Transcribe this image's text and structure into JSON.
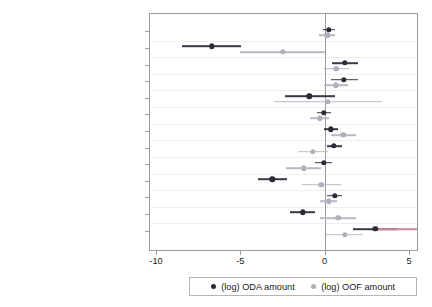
{
  "chart_data": {
    "type": "scatter",
    "title": "",
    "xlabel": "",
    "ylabel": "",
    "xlim": [
      -10,
      5
    ],
    "xticks": [
      -10,
      -5,
      0,
      5
    ],
    "xtick_labels": [
      "-10",
      "-5",
      "0",
      "5"
    ],
    "grid": true,
    "grid_orientation": "horizontal",
    "zero_reference_line": 0,
    "legend_position": "bottom",
    "orientation": "horizontal",
    "categories": [
      "UN voting with China",
      "Taiwan recognition",
      "Historical probability",
      "Trade with China (log)",
      "Oil dummy",
      "Debt/GDP",
      "Stability",
      "Polity",
      "Control of corruption",
      "GDP per capita (log)",
      "Killed from disasters (log)",
      "Population (log)",
      "English language"
    ],
    "series": [
      {
        "name": "(log) ODA amount",
        "color": "#2b2b36",
        "marker": "circle",
        "values": [
          0.25,
          -6.7,
          1.2,
          1.15,
          -0.9,
          -0.05,
          0.35,
          0.55,
          -0.05,
          -3.1,
          0.6,
          -1.3,
          3.0
        ],
        "ci_low": [
          -0.1,
          -8.45,
          0.45,
          0.4,
          -2.35,
          -0.45,
          -0.05,
          0.15,
          -0.55,
          -3.95,
          0.15,
          -2.05,
          1.7
        ],
        "ci_high": [
          0.6,
          -4.95,
          1.95,
          1.95,
          0.6,
          0.35,
          0.8,
          1.0,
          0.45,
          -2.25,
          1.05,
          -0.55,
          4.3
        ],
        "ci_high_overflow": [
          false,
          false,
          false,
          false,
          false,
          false,
          false,
          false,
          false,
          false,
          false,
          false,
          true
        ]
      },
      {
        "name": "(log) OOF amount",
        "color": "#b0b0bd",
        "marker": "diamond",
        "values": [
          0.15,
          -2.5,
          0.7,
          0.65,
          0.2,
          -0.3,
          1.1,
          -0.7,
          -1.25,
          -0.2,
          0.25,
          0.8,
          1.2
        ],
        "ci_low": [
          -0.35,
          -5.0,
          -0.05,
          -0.05,
          -3.0,
          -0.85,
          0.35,
          -1.6,
          -2.3,
          -1.35,
          -0.25,
          -0.25,
          0.1
        ],
        "ci_high": [
          0.6,
          0.0,
          1.45,
          1.4,
          3.4,
          0.25,
          1.85,
          0.2,
          -0.2,
          0.95,
          0.75,
          1.85,
          2.3
        ],
        "ci_high_overflow": [
          false,
          false,
          false,
          false,
          false,
          false,
          false,
          false,
          false,
          false,
          false,
          false,
          false
        ]
      }
    ]
  },
  "legend": {
    "items": [
      {
        "label": "(log) ODA amount",
        "marker": "circle-marker"
      },
      {
        "label": "(log) OOF amount",
        "marker": "diamond-marker"
      }
    ]
  }
}
